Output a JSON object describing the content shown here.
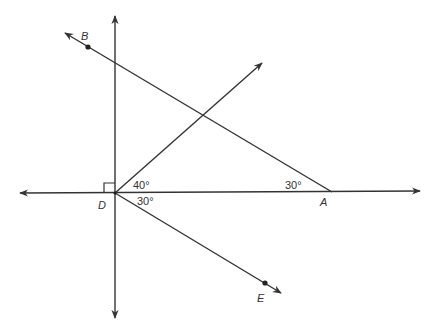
{
  "diagram": {
    "type": "geometry",
    "points": {
      "A": {
        "label": "A"
      },
      "B": {
        "label": "B"
      },
      "D": {
        "label": "D"
      },
      "E": {
        "label": "E"
      }
    },
    "angles": {
      "angle_upper_at_D": "40°",
      "angle_lower_at_D": "30°",
      "angle_at_A": "30°"
    },
    "right_angle_marker_at": "D",
    "colors": {
      "line": "#333333",
      "background": "#ffffff"
    }
  }
}
